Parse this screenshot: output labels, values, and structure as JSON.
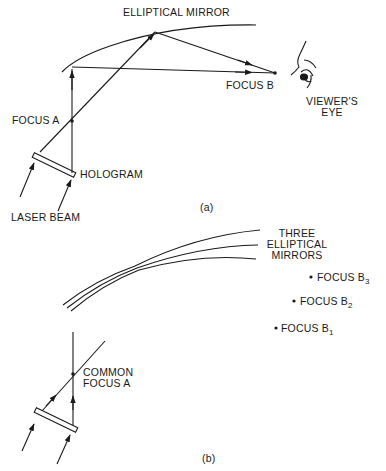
{
  "panel_a": {
    "caption": "(a)",
    "labels": {
      "mirror": "ELLIPTICAL MIRROR",
      "focus_a": "FOCUS A",
      "focus_b": "FOCUS B",
      "hologram": "HOLOGRAM",
      "laser_beam": "LASER BEAM",
      "viewer_line1": "VIEWER'S",
      "viewer_line2": "EYE"
    }
  },
  "panel_b": {
    "caption": "(b)",
    "labels": {
      "mirrors_line1": "THREE",
      "mirrors_line2": "ELLIPTICAL",
      "mirrors_line3": "MIRRORS",
      "focus_b3": "FOCUS B",
      "focus_b3_sub": "3",
      "focus_b2": "FOCUS B",
      "focus_b2_sub": "2",
      "focus_b1": "FOCUS B",
      "focus_b1_sub": "1",
      "common_line1": "COMMON",
      "common_line2": "FOCUS A"
    }
  },
  "colors": {
    "ink": "#1a1a1a",
    "background": "#ffffff"
  }
}
